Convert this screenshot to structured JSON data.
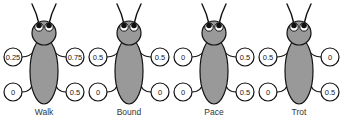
{
  "figure": {
    "colors": {
      "body": "#999999",
      "outline": "#111111",
      "leg_circle_fill": "#ffffff",
      "text": "#222222"
    },
    "gaits": [
      {
        "label": "Walk",
        "cx": 44,
        "legs": {
          "front_left": "0.25",
          "front_right": "0.75",
          "hind_left": "0",
          "hind_right": "0.5"
        }
      },
      {
        "label": "Bound",
        "cx": 129,
        "legs": {
          "front_left": "0.5",
          "front_right": "0.5",
          "hind_left": "0",
          "hind_right": "0"
        }
      },
      {
        "label": "Pace",
        "cx": 214,
        "legs": {
          "front_left": "0",
          "front_right": "0.5",
          "hind_left": "0",
          "hind_right": "0.5"
        }
      },
      {
        "label": "Trot",
        "cx": 299,
        "legs": {
          "front_left": "0.5",
          "front_right": "0",
          "hind_left": "0",
          "hind_right": "0.5"
        }
      }
    ]
  }
}
